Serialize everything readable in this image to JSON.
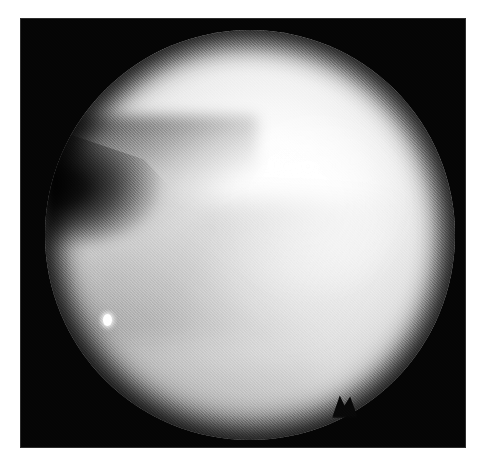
{
  "figure": {
    "kind": "arthroscopic-photograph",
    "modality_label": "Arthroscopy",
    "color_mode": "grayscale",
    "width_px": 486,
    "height_px": 468,
    "border": {
      "color": "#ffffff",
      "left_px": 20,
      "top_px": 18,
      "right_px": 20,
      "bottom_px": 20
    },
    "plate": {
      "background_color": "#050505",
      "left_px": 20,
      "top_px": 18,
      "width_px": 446,
      "height_px": 430
    }
  },
  "field_of_view": {
    "shape": "circle",
    "center_x_px": 250,
    "center_y_px": 235,
    "radius_px": 205,
    "brightest_color": "#ffffff",
    "rim_color": "#9e9e9e",
    "outside_color": "#050505"
  },
  "anatomy": {
    "structures": [
      {
        "name": "femoral-condyle",
        "description": "Large convex bright articular cartilage surface filling the upper and right field",
        "tone": "#ffffff",
        "position": "upper-right"
      },
      {
        "name": "tibial-plateau",
        "description": "Lower convex cartilage surface, slightly duller than the condyle",
        "tone": "#dcdcdc",
        "position": "lower-left"
      },
      {
        "name": "joint-space-cleft",
        "description": "Dark triangular recess between the two articular surfaces, tapering to a point toward the centre",
        "tone": "#0a0a0a",
        "position": "left"
      },
      {
        "name": "meniscal-margin-shadow",
        "description": "Soft diagonal shading band running from the cleft apex toward the lower right",
        "tone": "#c8c8c8",
        "position": "mid-field"
      }
    ]
  },
  "artifacts": [
    {
      "name": "specular-highlight",
      "description": "Bright pinpoint light reflection on the cartilage surface",
      "x_px": 107,
      "y_px": 320,
      "color": "#ffffff"
    },
    {
      "name": "specular-dot",
      "description": "Faint secondary pinpoint reflection",
      "x_px": 80,
      "y_px": 370,
      "color": "#f2f2f2"
    },
    {
      "name": "barrel-edge-notch",
      "description": "Small V-shaped notch intruding on the lower barrel edge",
      "x_px": 345,
      "y_px": 412,
      "color": "#080808"
    },
    {
      "name": "film-grain",
      "description": "Uniform photographic grain across the whole frame",
      "opacity": 0.22
    }
  ],
  "illumination": {
    "source": "endoscope-light",
    "hotspot_x_px": 250,
    "hotspot_y_px": 175,
    "falloff": "radial-vignette",
    "vignette_color": "#000000"
  }
}
